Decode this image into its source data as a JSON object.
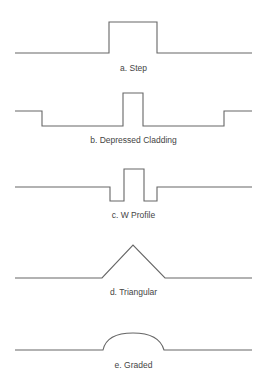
{
  "diagram": {
    "line_color": "#666666",
    "background": "#ffffff",
    "profiles": [
      {
        "id": "a",
        "caption": "a. Step",
        "shape": "step"
      },
      {
        "id": "b",
        "caption": "b. Depressed Cladding",
        "shape": "depressed-cladding"
      },
      {
        "id": "c",
        "caption": "c. W Profile",
        "shape": "w-profile"
      },
      {
        "id": "d",
        "caption": "d. Triangular",
        "shape": "triangular"
      },
      {
        "id": "e",
        "caption": "e. Graded",
        "shape": "graded"
      }
    ]
  }
}
